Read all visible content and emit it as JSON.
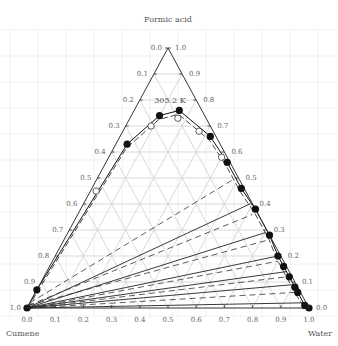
{
  "diagram": {
    "type": "ternary",
    "temperature_label": "305.2 K",
    "vertices": {
      "top": "Formic acid",
      "bottom_left": "Cumene",
      "bottom_right": "Water"
    },
    "left_axis_ticks": [
      "0.0",
      "0.1",
      "0.2",
      "0.3",
      "0.4",
      "0.5",
      "0.6",
      "0.7",
      "0.8",
      "0.9",
      "1.0"
    ],
    "right_axis_ticks": [
      "1.0",
      "0.9",
      "0.8",
      "0.7",
      "0.6",
      "0.5",
      "0.4",
      "0.3",
      "0.2",
      "0.1",
      "0.0"
    ],
    "bottom_axis_ticks": [
      "0.0",
      "0.1",
      "0.2",
      "0.3",
      "0.4",
      "0.5",
      "0.6",
      "0.7",
      "0.8",
      "0.9",
      "1.0"
    ],
    "colors": {
      "axis": "#333333",
      "grid": "#cfcfcf",
      "data": "#111111",
      "bg_grid": "#f1f1f1"
    }
  },
  "chart_data": {
    "type": "ternary",
    "title": "305.2 K",
    "components": [
      "Formic acid",
      "Water",
      "Cumene"
    ],
    "experimental_binodal": [
      {
        "formic": 0.0,
        "water": 0.0
      },
      {
        "formic": 0.07,
        "water": 0.0
      },
      {
        "formic": 0.63,
        "water": 0.04
      },
      {
        "formic": 0.74,
        "water": 0.1
      },
      {
        "formic": 0.76,
        "water": 0.16
      },
      {
        "formic": 0.66,
        "water": 0.32
      },
      {
        "formic": 0.56,
        "water": 0.43
      },
      {
        "formic": 0.46,
        "water": 0.53
      },
      {
        "formic": 0.38,
        "water": 0.62
      },
      {
        "formic": 0.28,
        "water": 0.72
      },
      {
        "formic": 0.2,
        "water": 0.79
      },
      {
        "formic": 0.16,
        "water": 0.83
      },
      {
        "formic": 0.12,
        "water": 0.87
      },
      {
        "formic": 0.08,
        "water": 0.91
      },
      {
        "formic": 0.06,
        "water": 0.93
      },
      {
        "formic": 0.01,
        "water": 0.98
      },
      {
        "formic": 0.0,
        "water": 1.0
      }
    ],
    "calculated_binodal_open": [
      {
        "formic": 0.45,
        "water": 0.02
      },
      {
        "formic": 0.7,
        "water": 0.09
      },
      {
        "formic": 0.73,
        "water": 0.17
      },
      {
        "formic": 0.68,
        "water": 0.27
      },
      {
        "formic": 0.58,
        "water": 0.4
      }
    ],
    "tie_lines_experimental": [
      [
        {
          "formic": 0.0,
          "water": 0.0
        },
        {
          "formic": 0.4,
          "water": 0.59
        }
      ],
      [
        {
          "formic": 0.0,
          "water": 0.0
        },
        {
          "formic": 0.29,
          "water": 0.7
        }
      ],
      [
        {
          "formic": 0.0,
          "water": 0.0
        },
        {
          "formic": 0.2,
          "water": 0.79
        }
      ],
      [
        {
          "formic": 0.0,
          "water": 0.0
        },
        {
          "formic": 0.14,
          "water": 0.85
        }
      ],
      [
        {
          "formic": 0.0,
          "water": 0.0
        },
        {
          "formic": 0.09,
          "water": 0.9
        }
      ],
      [
        {
          "formic": 0.0,
          "water": 0.0
        },
        {
          "formic": 0.02,
          "water": 0.97
        }
      ]
    ],
    "tie_lines_calculated": [
      [
        {
          "formic": 0.02,
          "water": 0.0
        },
        {
          "formic": 0.5,
          "water": 0.49
        }
      ],
      [
        {
          "formic": 0.01,
          "water": 0.0
        },
        {
          "formic": 0.36,
          "water": 0.62
        }
      ],
      [
        {
          "formic": 0.01,
          "water": 0.0
        },
        {
          "formic": 0.26,
          "water": 0.72
        }
      ],
      [
        {
          "formic": 0.0,
          "water": 0.01
        },
        {
          "formic": 0.18,
          "water": 0.8
        }
      ],
      [
        {
          "formic": 0.0,
          "water": 0.01
        },
        {
          "formic": 0.12,
          "water": 0.86
        }
      ],
      [
        {
          "formic": 0.0,
          "water": 0.01
        },
        {
          "formic": 0.06,
          "water": 0.92
        }
      ]
    ],
    "grid": true
  }
}
